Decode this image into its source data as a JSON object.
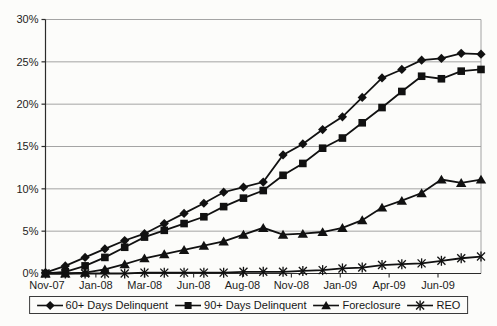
{
  "chart_data": {
    "type": "line",
    "title": "",
    "grid": true,
    "legend_position": "bottom",
    "colors": {
      "series": "#111111",
      "gridline": "#9a9a9a",
      "axis": "#2b2b2b",
      "text": "#1c1c1c"
    },
    "y_axis": {
      "min": 0,
      "max": 30,
      "step": 5,
      "tick_labels": [
        "0%",
        "5%",
        "10%",
        "15%",
        "20%",
        "25%",
        "30%"
      ]
    },
    "x_axis": {
      "tick_labels": [
        "Nov-07",
        "Jan-08",
        "Mar-08",
        "Jun-08",
        "Aug-08",
        "Nov-08",
        "Jan-09",
        "Apr-09",
        "Jun-09"
      ]
    },
    "categories": [
      "Nov-07",
      "Dec-07",
      "Jan-08",
      "Feb-08",
      "Mar-08",
      "Apr-08",
      "May-08",
      "Jun-08",
      "Jul-08",
      "Aug-08",
      "Sep-08",
      "Oct-08",
      "Nov-08",
      "Dec-08",
      "Jan-09",
      "Feb-09",
      "Mar-09",
      "Apr-09",
      "May-09",
      "Jun-09",
      "Jul-09",
      "Aug-09",
      "Sep-09"
    ],
    "series": [
      {
        "name": "60+ Days Delinquent",
        "marker": "diamond",
        "color": "#111111",
        "values": [
          0.1,
          0.9,
          1.9,
          2.9,
          3.9,
          4.7,
          5.9,
          7.1,
          8.3,
          9.6,
          10.2,
          10.8,
          14.0,
          15.3,
          17.0,
          18.5,
          20.8,
          23.1,
          24.1,
          25.2,
          25.4,
          26.0,
          25.9
        ]
      },
      {
        "name": "90+ Days Delinquent",
        "marker": "square",
        "color": "#111111",
        "values": [
          0.0,
          0.2,
          0.9,
          1.9,
          3.1,
          4.3,
          5.1,
          5.9,
          6.7,
          7.9,
          8.9,
          9.8,
          11.6,
          13.0,
          14.8,
          16.0,
          17.8,
          19.6,
          21.5,
          23.3,
          23.0,
          23.9,
          24.1
        ]
      },
      {
        "name": "Foreclosure",
        "marker": "triangle",
        "color": "#111111",
        "values": [
          0.0,
          0.0,
          0.1,
          0.5,
          1.1,
          1.8,
          2.3,
          2.8,
          3.3,
          3.8,
          4.6,
          5.4,
          4.6,
          4.7,
          4.9,
          5.4,
          6.3,
          7.8,
          8.6,
          9.5,
          11.1,
          10.7,
          11.1
        ]
      },
      {
        "name": "REO",
        "marker": "star",
        "color": "#111111",
        "values": [
          0.0,
          0.0,
          0.0,
          0.0,
          0.0,
          0.1,
          0.1,
          0.1,
          0.1,
          0.1,
          0.2,
          0.2,
          0.2,
          0.3,
          0.4,
          0.6,
          0.7,
          1.0,
          1.1,
          1.2,
          1.5,
          1.8,
          2.0
        ]
      }
    ]
  }
}
